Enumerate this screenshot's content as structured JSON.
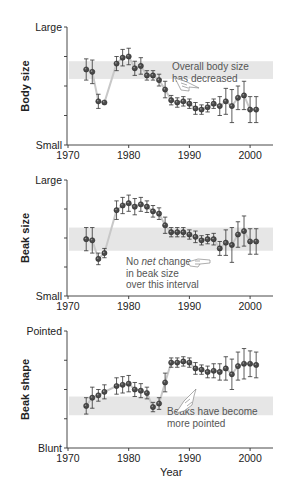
{
  "chart_data": [
    {
      "type": "scatter",
      "title": "",
      "xlabel": "",
      "ylabel": "Body size",
      "y_top_label": "Large",
      "y_bottom_label": "Small",
      "xlim": [
        1970,
        2004
      ],
      "ylim": [
        0,
        1
      ],
      "xticks": [
        1970,
        1980,
        1990,
        2000
      ],
      "grid": false,
      "band": [
        0.56,
        0.71
      ],
      "band_color": "#e6e6e6",
      "annotation": {
        "lines": [
          "Overall body size",
          "has decreased"
        ],
        "italic_word": null,
        "hand_icon": "pointing-hand-icon"
      },
      "x": [
        1973,
        1974,
        1975,
        1976,
        1978,
        1979,
        1980,
        1981,
        1982,
        1983,
        1984,
        1985,
        1986,
        1987,
        1988,
        1989,
        1990,
        1991,
        1992,
        1993,
        1994,
        1995,
        1996,
        1997,
        1998,
        1999,
        2000,
        2001
      ],
      "values": [
        0.64,
        0.62,
        0.37,
        0.36,
        0.69,
        0.74,
        0.75,
        0.65,
        0.67,
        0.59,
        0.59,
        0.55,
        0.47,
        0.38,
        0.36,
        0.37,
        0.35,
        0.31,
        0.3,
        0.32,
        0.35,
        0.33,
        0.37,
        0.33,
        0.4,
        0.42,
        0.3,
        0.3
      ],
      "errors": [
        0.09,
        0.1,
        0.06,
        0.0,
        0.06,
        0.07,
        0.07,
        0.06,
        0.07,
        0.04,
        0.04,
        0.05,
        0.07,
        0.04,
        0.04,
        0.04,
        0.04,
        0.05,
        0.04,
        0.04,
        0.04,
        0.08,
        0.11,
        0.14,
        0.1,
        0.12,
        0.11,
        0.11
      ]
    },
    {
      "type": "scatter",
      "title": "",
      "xlabel": "",
      "ylabel": "Beak size",
      "y_top_label": "Large",
      "y_bottom_label": "Small",
      "xlim": [
        1970,
        2004
      ],
      "ylim": [
        0,
        1
      ],
      "xticks": [
        1970,
        1980,
        1990,
        2000
      ],
      "grid": false,
      "band": [
        0.39,
        0.59
      ],
      "band_color": "#e6e6e6",
      "annotation": {
        "lines": [
          "No net change",
          "in beak size",
          "over this interval"
        ],
        "italic_word": "net",
        "hand_icon": "pointing-hand-icon"
      },
      "x": [
        1973,
        1974,
        1975,
        1976,
        1978,
        1979,
        1980,
        1981,
        1982,
        1983,
        1984,
        1985,
        1986,
        1987,
        1988,
        1989,
        1990,
        1991,
        1992,
        1993,
        1994,
        1995,
        1996,
        1997,
        1998,
        1999,
        2000,
        2001
      ],
      "values": [
        0.49,
        0.48,
        0.32,
        0.37,
        0.74,
        0.78,
        0.8,
        0.77,
        0.79,
        0.77,
        0.73,
        0.71,
        0.61,
        0.55,
        0.55,
        0.55,
        0.53,
        0.51,
        0.48,
        0.49,
        0.49,
        0.41,
        0.46,
        0.44,
        0.53,
        0.56,
        0.47,
        0.47
      ],
      "errors": [
        0.1,
        0.11,
        0.05,
        0.04,
        0.08,
        0.07,
        0.07,
        0.07,
        0.06,
        0.05,
        0.05,
        0.05,
        0.07,
        0.04,
        0.04,
        0.04,
        0.04,
        0.05,
        0.04,
        0.04,
        0.05,
        0.06,
        0.11,
        0.15,
        0.11,
        0.13,
        0.11,
        0.11
      ]
    },
    {
      "type": "scatter",
      "title": "",
      "xlabel": "Year",
      "ylabel": "Beak shape",
      "y_top_label": "Pointed",
      "y_bottom_label": "Blunt",
      "xlim": [
        1970,
        2004
      ],
      "ylim": [
        0,
        1
      ],
      "xticks": [
        1970,
        1980,
        1990,
        2000
      ],
      "grid": false,
      "band": [
        0.28,
        0.44
      ],
      "band_color": "#e6e6e6",
      "annotation": {
        "lines": [
          "Beaks have become",
          "more pointed"
        ],
        "italic_word": null,
        "hand_icon": "pointing-hand-icon"
      },
      "x": [
        1973,
        1974,
        1975,
        1976,
        1978,
        1979,
        1980,
        1981,
        1982,
        1983,
        1984,
        1985,
        1986,
        1987,
        1988,
        1989,
        1990,
        1991,
        1992,
        1993,
        1994,
        1995,
        1996,
        1997,
        1998,
        1999,
        2000,
        2001
      ],
      "values": [
        0.36,
        0.43,
        0.45,
        0.48,
        0.53,
        0.54,
        0.55,
        0.5,
        0.49,
        0.47,
        0.35,
        0.38,
        0.56,
        0.73,
        0.73,
        0.74,
        0.73,
        0.68,
        0.67,
        0.65,
        0.66,
        0.65,
        0.68,
        0.63,
        0.7,
        0.72,
        0.72,
        0.71
      ],
      "errors": [
        0.07,
        0.09,
        0.05,
        0.06,
        0.07,
        0.07,
        0.07,
        0.06,
        0.06,
        0.05,
        0.04,
        0.05,
        0.08,
        0.04,
        0.04,
        0.04,
        0.04,
        0.05,
        0.04,
        0.05,
        0.06,
        0.07,
        0.1,
        0.13,
        0.12,
        0.13,
        0.11,
        0.11
      ]
    }
  ],
  "colors": {
    "marker": "#4a4a4a",
    "marker_highlight": "#9a9a9a",
    "errorbar": "#333333",
    "connector": "#c8c8c8",
    "axis": "#333333",
    "band": "#e6e6e6",
    "annotation_text": "#555555"
  }
}
